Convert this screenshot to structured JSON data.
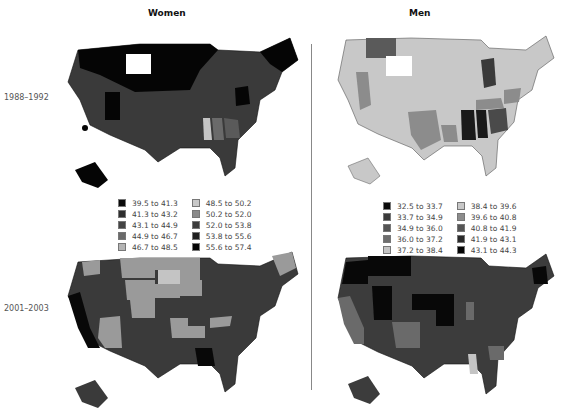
{
  "columns": {
    "women": "Women",
    "men": "Men"
  },
  "rows": {
    "period1": "1988–1992",
    "period2": "2001–2003"
  },
  "legend_women": [
    {
      "label": "39.5 to 41.3",
      "color": "#0a0a0a"
    },
    {
      "label": "41.3 to 43.2",
      "color": "#2e2e2e"
    },
    {
      "label": "43.1 to 44.9",
      "color": "#444444"
    },
    {
      "label": "44.9 to 46.7",
      "color": "#6a6a6a"
    },
    {
      "label": "46.7 to 48.5",
      "color": "#b4b4b4"
    },
    {
      "label": "48.5 to 50.2",
      "color": "#c8c8c8"
    },
    {
      "label": "50.2 to 52.0",
      "color": "#8a8a8a"
    },
    {
      "label": "52.0 to 53.8",
      "color": "#3c3c3c"
    },
    {
      "label": "53.8 to 55.6",
      "color": "#1e1e1e"
    },
    {
      "label": "55.6 to 57.4",
      "color": "#050505"
    }
  ],
  "legend_men": [
    {
      "label": "32.5 to 33.7",
      "color": "#0a0a0a"
    },
    {
      "label": "33.7 to 34.9",
      "color": "#3a3a3a"
    },
    {
      "label": "34.9 to 36.0",
      "color": "#555555"
    },
    {
      "label": "36.0 to 37.2",
      "color": "#6e6e6e"
    },
    {
      "label": "37.2 to 38.4",
      "color": "#c4c4c4"
    },
    {
      "label": "38.4 to 39.6",
      "color": "#c8c8c8"
    },
    {
      "label": "39.6 to 40.8",
      "color": "#8c8c8c"
    },
    {
      "label": "40.8 to 41.9",
      "color": "#555555"
    },
    {
      "label": "41.9 to 43.1",
      "color": "#2a2a2a"
    },
    {
      "label": "43.1 to 44.3",
      "color": "#050505"
    }
  ],
  "maps": {
    "women_1988": {
      "base": "#3a3a3a",
      "north": "#050505",
      "southeast": "#5a5a5a",
      "light": "#c4c4c4",
      "missing": "#ffffff"
    },
    "men_1988": {
      "base": "#c8c8c8",
      "mid": "#8c8c8c",
      "dark": "#4a4a4a",
      "darkest": "#1a1a1a",
      "missing": "#ffffff"
    },
    "women_2001": {
      "base": "#3a3a3a",
      "light": "#9a9a9a",
      "lighter": "#c4c4c4",
      "dark": "#080808"
    },
    "men_2001": {
      "base": "#3c3c3c",
      "dark": "#080808",
      "light": "#c4c4c4",
      "mid": "#6a6a6a"
    }
  }
}
